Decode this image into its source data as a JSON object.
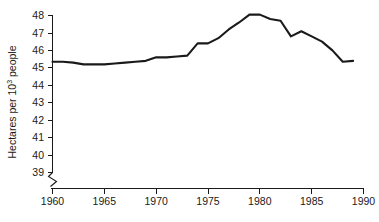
{
  "chart_data": {
    "type": "line",
    "title": "",
    "subtitle": "",
    "xlabel": "",
    "ylabel": "Hectares per 10³ people",
    "ylabel_parts": {
      "before": "Hectares per 10",
      "superscript": "3",
      "after": " people"
    },
    "xlim": [
      1960,
      1990
    ],
    "ylim": [
      38.6,
      48.4
    ],
    "yaxis_break": true,
    "yaxis_break_note": "zigzag break below 39 indicating truncated axis",
    "grid": false,
    "legend": false,
    "legend_position": "none",
    "line_color": "#1a1a1a",
    "xticks": [
      1960,
      1965,
      1970,
      1975,
      1980,
      1985,
      1990
    ],
    "xtick_labels": [
      "1960",
      "1965",
      "1970",
      "1975",
      "1980",
      "1985",
      "1990"
    ],
    "yticks": [
      39,
      40,
      41,
      42,
      43,
      44,
      45,
      46,
      47,
      48
    ],
    "ytick_labels": [
      "39",
      "40",
      "41",
      "42",
      "43",
      "44",
      "45",
      "46",
      "47",
      "48"
    ],
    "x": [
      1960,
      1961,
      1962,
      1963,
      1964,
      1965,
      1966,
      1967,
      1968,
      1969,
      1970,
      1971,
      1972,
      1973,
      1974,
      1975,
      1976,
      1977,
      1978,
      1979,
      1980,
      1981,
      1982,
      1983,
      1984,
      1985,
      1986,
      1987,
      1988,
      1989
    ],
    "values": [
      45.35,
      45.35,
      45.3,
      45.2,
      45.2,
      45.2,
      45.25,
      45.3,
      45.35,
      45.4,
      45.6,
      45.6,
      45.65,
      45.7,
      46.4,
      46.4,
      46.7,
      47.2,
      47.6,
      48.05,
      48.05,
      47.8,
      47.7,
      46.8,
      47.1,
      46.8,
      46.5,
      46.0,
      45.35,
      45.4
    ],
    "series": [
      {
        "name": "Hectares per 10³ people",
        "values": [
          45.35,
          45.35,
          45.3,
          45.2,
          45.2,
          45.2,
          45.25,
          45.3,
          45.35,
          45.4,
          45.6,
          45.6,
          45.65,
          45.7,
          46.4,
          46.4,
          46.7,
          47.2,
          47.6,
          48.05,
          48.05,
          47.8,
          47.7,
          46.8,
          47.1,
          46.8,
          46.5,
          46.0,
          45.35,
          45.4
        ]
      }
    ],
    "annotations": []
  }
}
